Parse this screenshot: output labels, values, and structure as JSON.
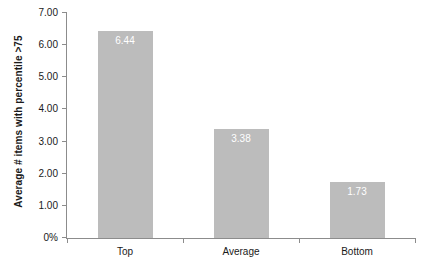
{
  "chart_data": {
    "type": "bar",
    "title": "",
    "subtitle": "",
    "xlabel": "",
    "ylabel": "Average # items with percentile >75",
    "categories": [
      "Top",
      "Average",
      "Bottom"
    ],
    "values": [
      6.44,
      1.73,
      3.38
    ],
    "series": [
      {
        "name": "",
        "values": [
          6.44,
          3.38,
          1.73
        ]
      }
    ],
    "data_labels": [
      "6.44",
      "3.38",
      "1.73"
    ],
    "ylim": [
      0,
      7
    ],
    "ytick_values": [
      0,
      1,
      2,
      3,
      4,
      5,
      6,
      7
    ],
    "ytick_labels": [
      "0%",
      "1.00",
      "2.00",
      "3.00",
      "4.00",
      "5.00",
      "6.00",
      "7.00"
    ],
    "grid": false,
    "legend": false,
    "legend_position": "none",
    "bar_color": "#bcbcbc",
    "data_label_color": "#ffffff",
    "axis_color": "#8c8c8c",
    "text_color": "#1a1a1a",
    "background_color": "#ffffff"
  }
}
